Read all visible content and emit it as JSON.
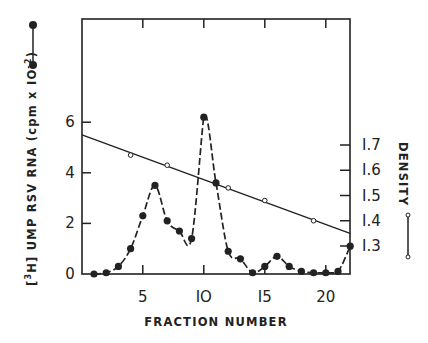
{
  "chart_data": {
    "type": "line",
    "title": "",
    "xlabel": "FRACTION NUMBER",
    "ylabel": "[3H] UMP RSV RNA (cpm x 10^-2)",
    "ylabel_parts": {
      "bracket_open": "[",
      "sup": "3",
      "elem": "H",
      "bracket_close": "]",
      "text": " UMP RSV RNA (cpm x IO",
      "exp": "-2",
      "close": ")"
    },
    "y2label": "DENSITY",
    "x_ticks": [
      5,
      10,
      15,
      20
    ],
    "x_tick_labels": [
      "5",
      "IO",
      "I5",
      "20"
    ],
    "y_ticks": [
      0,
      2,
      4,
      6
    ],
    "y_tick_labels": [
      "0",
      "2",
      "4",
      "6"
    ],
    "y2_ticks": [
      1.3,
      1.4,
      1.5,
      1.6,
      1.7
    ],
    "y2_tick_labels": [
      "I.3",
      "I.4",
      "I.5",
      "I.6",
      "I.7"
    ],
    "xlim": [
      0,
      22
    ],
    "ylim": [
      0,
      8.5
    ],
    "y2lim": [
      1.3,
      1.7
    ],
    "grid": false,
    "legend": {
      "left_axis_marker": "filled-circle-line",
      "right_axis_marker": "open-circle-line"
    },
    "series": [
      {
        "name": "[3H] UMP RSV RNA",
        "axis": "left",
        "marker": "filled-circle",
        "x": [
          1,
          2,
          3,
          4,
          5,
          6,
          7,
          8,
          9,
          10,
          11,
          12,
          13,
          14,
          15,
          16,
          17,
          18,
          19,
          20,
          21,
          22
        ],
        "values": [
          0.0,
          0.05,
          0.3,
          1.0,
          2.3,
          3.5,
          2.1,
          1.7,
          1.4,
          6.2,
          3.6,
          0.9,
          0.6,
          0.05,
          0.3,
          0.7,
          0.3,
          0.1,
          0.05,
          0.05,
          0.1,
          1.1
        ]
      },
      {
        "name": "Density",
        "axis": "right",
        "marker": "open-circle",
        "x": [
          4,
          7,
          12,
          15,
          19
        ],
        "values": [
          1.66,
          1.62,
          1.53,
          1.48,
          1.4
        ],
        "fit_line": {
          "x": [
            0,
            22
          ],
          "values": [
            1.74,
            1.35
          ]
        }
      }
    ]
  }
}
